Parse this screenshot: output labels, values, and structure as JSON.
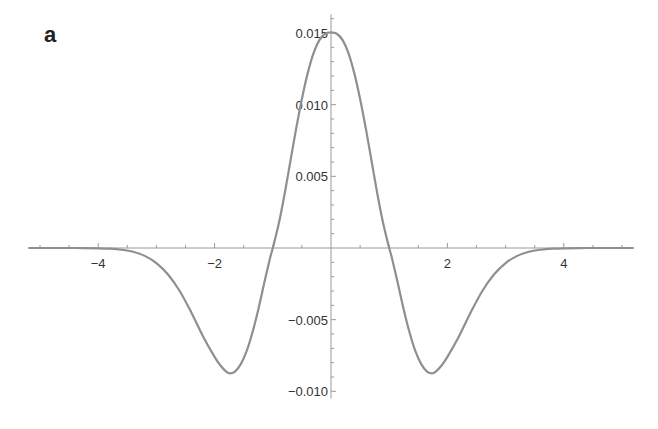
{
  "panel_label": "a",
  "chart_data": {
    "type": "line",
    "title": "",
    "xlabel": "",
    "ylabel": "",
    "xlim": [
      -5.2,
      5.2
    ],
    "ylim": [
      -0.0105,
      0.0163
    ],
    "x_ticks": [
      -4,
      -2,
      2,
      4
    ],
    "x_tick_labels": [
      "-4",
      "-2",
      "2",
      "4"
    ],
    "y_ticks": [
      0.015,
      0.01,
      0.005,
      -0.005,
      -0.01
    ],
    "y_tick_labels": [
      "0.015",
      "0.010",
      "0.005",
      "-0.005",
      "-0.010"
    ],
    "grid": false,
    "legend": null,
    "line_color": "#8f8f8f",
    "series": [
      {
        "name": "curve",
        "x": [
          -5.2,
          -4.8,
          -4.4,
          -4.0,
          -3.8,
          -3.6,
          -3.4,
          -3.2,
          -3.0,
          -2.8,
          -2.6,
          -2.4,
          -2.2,
          -2.0,
          -1.9,
          -1.8,
          -1.74,
          -1.65,
          -1.55,
          -1.45,
          -1.35,
          -1.25,
          -1.15,
          -1.05,
          -1.0,
          -0.9,
          -0.8,
          -0.7,
          -0.6,
          -0.5,
          -0.4,
          -0.3,
          -0.2,
          -0.1,
          0.0,
          0.1,
          0.2,
          0.3,
          0.4,
          0.5,
          0.6,
          0.7,
          0.8,
          0.9,
          1.0,
          1.05,
          1.15,
          1.25,
          1.35,
          1.45,
          1.55,
          1.65,
          1.74,
          1.8,
          1.9,
          2.0,
          2.2,
          2.4,
          2.6,
          2.8,
          3.0,
          3.2,
          3.4,
          3.6,
          3.8,
          4.0,
          4.4,
          4.8,
          5.2
        ],
        "y": [
          0,
          0,
          0,
          -2e-05,
          -5e-05,
          -0.00012,
          -0.00026,
          -0.00055,
          -0.00105,
          -0.00185,
          -0.003,
          -0.0045,
          -0.00615,
          -0.0076,
          -0.0082,
          -0.00862,
          -0.00875,
          -0.00862,
          -0.0081,
          -0.0072,
          -0.0059,
          -0.0043,
          -0.0025,
          -0.00075,
          0.0,
          0.00165,
          0.0037,
          0.006,
          0.0083,
          0.0104,
          0.0122,
          0.0136,
          0.0145,
          0.01495,
          0.01505,
          0.01495,
          0.0145,
          0.0136,
          0.0122,
          0.0104,
          0.0083,
          0.006,
          0.0037,
          0.00165,
          0.0,
          -0.00075,
          -0.0025,
          -0.0043,
          -0.0059,
          -0.0072,
          -0.0081,
          -0.00862,
          -0.00875,
          -0.00862,
          -0.0082,
          -0.0076,
          -0.00615,
          -0.0045,
          -0.003,
          -0.00185,
          -0.00105,
          -0.00055,
          -0.00026,
          -0.00012,
          -5e-05,
          -2e-05,
          0,
          0,
          0
        ]
      }
    ]
  }
}
